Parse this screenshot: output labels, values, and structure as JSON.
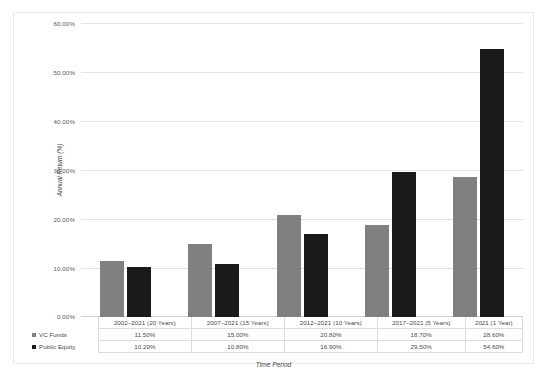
{
  "chart_data": {
    "type": "bar",
    "title": "",
    "xlabel": "Time Period",
    "ylabel": "Annual Return (%)",
    "categories": [
      "2002–2021 (20 Years)",
      "2007–2021 (15 Years)",
      "2012–2021 (10 Years)",
      "2017–2021 (5 Years)",
      "2021 (1 Year)"
    ],
    "series": [
      {
        "name": "VC Funds",
        "color": "#808080",
        "values": [
          11.5,
          15.0,
          20.8,
          18.7,
          28.6
        ],
        "labels": [
          "11.50%",
          "15.00%",
          "20.80%",
          "18.70%",
          "28.60%"
        ]
      },
      {
        "name": "Public Equity",
        "color": "#1a1a1a",
        "values": [
          10.2,
          10.8,
          16.9,
          29.5,
          54.6
        ],
        "labels": [
          "10.20%",
          "10.80%",
          "16.90%",
          "29.50%",
          "54.60%"
        ]
      }
    ],
    "ylim": [
      0,
      60
    ],
    "yticks": [
      0,
      10,
      20,
      30,
      40,
      50,
      60
    ],
    "ytick_labels": [
      "0.00%",
      "10.00%",
      "20.00%",
      "30.00%",
      "40.00%",
      "50.00%",
      "60.00%"
    ],
    "grid": true,
    "legend_position": "table-row-headers"
  },
  "table": {
    "row_header_vc": "VC Funds",
    "row_header_pe": "Public Equity"
  }
}
